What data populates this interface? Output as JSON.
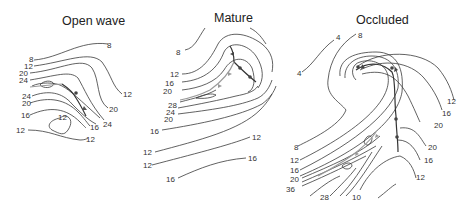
{
  "figure": {
    "type": "cyclone life-cycle schematic (isotherm/thickness contours with fronts)",
    "panels": [
      {
        "id": "open-wave",
        "title": "Open wave",
        "contour_labels": [
          "8",
          "8",
          "12",
          "20",
          "24",
          "24",
          "20",
          "16",
          "12",
          "12",
          "12",
          "20",
          "24",
          "16",
          "12"
        ]
      },
      {
        "id": "mature",
        "title": "Mature",
        "contour_labels": [
          "8",
          "12",
          "16",
          "20",
          "28",
          "24",
          "20",
          "16",
          "12",
          "12",
          "12",
          "16",
          "16"
        ]
      },
      {
        "id": "occluded",
        "title": "Occluded",
        "contour_labels": [
          "4",
          "4",
          "8",
          "12",
          "16",
          "20",
          "20",
          "16",
          "12",
          "8",
          "12",
          "16",
          "20",
          "36",
          "28",
          "10"
        ]
      }
    ]
  },
  "labels": {
    "ow_title": "Open wave",
    "ow_8a": "8",
    "ow_8b": "8",
    "ow_12a": "12",
    "ow_20a": "20",
    "ow_24a": "24",
    "ow_24b": "24",
    "ow_20b": "20",
    "ow_16a": "16",
    "ow_12b": "12",
    "ow_12c": "12",
    "ow_12d": "12",
    "ow_r12": "12",
    "ow_r20": "20",
    "ow_r24": "24",
    "ow_r16": "16",
    "m_title": "Mature",
    "m_8": "8",
    "m_12a": "12",
    "m_16a": "16",
    "m_20a": "20",
    "m_28": "28",
    "m_24": "24",
    "m_20b": "20",
    "m_16b": "16",
    "m_12b": "12",
    "m_12c": "12",
    "m_r12": "12",
    "m_r16": "16",
    "m_16c": "16",
    "o_title": "Occluded",
    "o_4a": "4",
    "o_4b": "4",
    "o_8a": "8",
    "o_r12": "12",
    "o_r16": "16",
    "o_r20": "20",
    "o_r20b": "20",
    "o_r16b": "16",
    "o_r12b": "12",
    "o_8b": "8",
    "o_12": "12",
    "o_16": "16",
    "o_20": "20",
    "o_36": "36",
    "o_28": "28",
    "o_10": "10"
  }
}
